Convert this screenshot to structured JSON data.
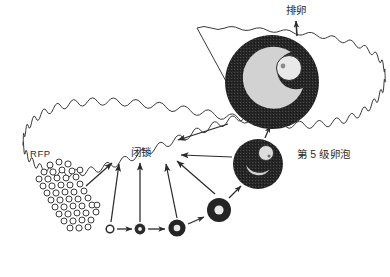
{
  "figure": {
    "title_visible": false,
    "background_color": "#ffffff",
    "ink_color": "#2b2b2b",
    "follicle_dark_color": "#262626",
    "follicle_light_color": "#d2d2d2",
    "oocyte_color": "#e6e6e6"
  },
  "labels": {
    "ovulation": "排卵",
    "atresia": "闭锁",
    "rfp": "RFP",
    "grade5_follicle": "第 5 级卵泡"
  },
  "ovary_outline": {
    "name": "ovary-boundary",
    "style": "scalloped-wavy-closed-curve",
    "stroke": "#3a3a3a",
    "fill": "#ffffff"
  },
  "structures": [
    {
      "name": "rfp-cluster",
      "label": "RFP",
      "count": 46,
      "shape": "small-open-circles",
      "cx": 70,
      "cy": 195
    },
    {
      "name": "follicle-stage-1",
      "cx": 110,
      "cy": 229,
      "r": 4.0,
      "type": "open-ring"
    },
    {
      "name": "follicle-stage-2",
      "cx": 140,
      "cy": 229,
      "r": 5.5,
      "type": "ring-with-dot"
    },
    {
      "name": "follicle-stage-3",
      "cx": 177,
      "cy": 228,
      "r": 8.5,
      "type": "thick-ring-light-center"
    },
    {
      "name": "follicle-stage-4",
      "cx": 219,
      "cy": 210,
      "r": 12.0,
      "type": "thick-ring-light-center"
    },
    {
      "name": "follicle-stage-5-medium",
      "cx": 258,
      "cy": 164,
      "r": 25.0,
      "type": "antral-follicle-with-oocyte"
    },
    {
      "name": "follicle-preovulatory-large",
      "cx": 272,
      "cy": 82,
      "r": 47.0,
      "type": "large-antral-follicle-with-oocyte"
    }
  ],
  "arrows": [
    {
      "name": "arrow-rfp-to-atresia",
      "from": "rfp-cluster",
      "to": "atresia"
    },
    {
      "name": "arrow-stage1-to-atresia",
      "from": "follicle-stage-1",
      "to": "atresia"
    },
    {
      "name": "arrow-stage2-to-atresia",
      "from": "follicle-stage-2",
      "to": "atresia"
    },
    {
      "name": "arrow-stage3-to-atresia",
      "from": "follicle-stage-3",
      "to": "atresia"
    },
    {
      "name": "arrow-stage4-to-atresia",
      "from": "follicle-stage-4",
      "to": "atresia"
    },
    {
      "name": "arrow-medium-to-atresia",
      "from": "follicle-stage-5-medium",
      "to": "atresia"
    },
    {
      "name": "arrow-large-to-atresia",
      "from": "follicle-preovulatory-large",
      "to": "atresia"
    },
    {
      "name": "arrow-stage1-to-stage2",
      "from": "follicle-stage-1",
      "to": "follicle-stage-2"
    },
    {
      "name": "arrow-stage2-to-stage3",
      "from": "follicle-stage-2",
      "to": "follicle-stage-3"
    },
    {
      "name": "arrow-stage3-to-stage4",
      "from": "follicle-stage-3",
      "to": "follicle-stage-4"
    },
    {
      "name": "arrow-stage4-to-medium",
      "from": "follicle-stage-4",
      "to": "follicle-stage-5-medium"
    },
    {
      "name": "arrow-medium-to-large",
      "from": "follicle-stage-5-medium",
      "to": "follicle-preovulatory-large"
    },
    {
      "name": "arrow-large-to-ovulation",
      "from": "follicle-preovulatory-large",
      "to": "ovulation"
    }
  ]
}
